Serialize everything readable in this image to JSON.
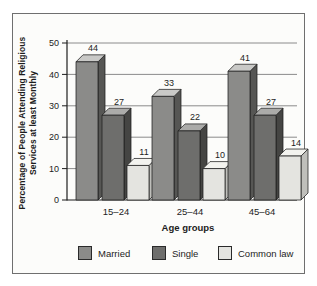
{
  "figure": {
    "background": "#fcfcfa",
    "frame_border_color": "#6f6f6f",
    "text_color": "#1d1d1d",
    "gridline_color": "#6f6f6f"
  },
  "chart_data": {
    "type": "bar",
    "title": "",
    "categories": [
      "15–24",
      "25–44",
      "45–64"
    ],
    "series": [
      {
        "name": "Married",
        "values": [
          44,
          33,
          41
        ],
        "front": "#8b8b89",
        "top": "#c9c9c7",
        "side": "#565654"
      },
      {
        "name": "Single",
        "values": [
          27,
          22,
          27
        ],
        "front": "#6e6e6c",
        "top": "#ababa9",
        "side": "#454543"
      },
      {
        "name": "Common law",
        "values": [
          11,
          10,
          14
        ],
        "front": "#e4e4e0",
        "top": "#f3f3ef",
        "side": "#bfbfbb"
      }
    ],
    "xlabel": "Age groups",
    "ylabel_line1": "Percentage of People Attending Religious",
    "ylabel_line2": "Services at least Monthly",
    "ylim": [
      0,
      50
    ],
    "yticks": [
      0,
      10,
      20,
      30,
      40,
      50
    ],
    "grid": true,
    "bar_style": "3d",
    "legend_position": "bottom"
  }
}
